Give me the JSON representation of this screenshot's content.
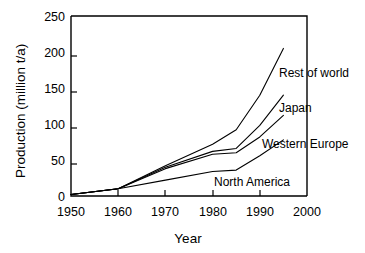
{
  "chart_data": {
    "type": "line",
    "title": "",
    "xlabel": "Year",
    "ylabel": "Production (million t/a)",
    "xlim": [
      1950,
      2000
    ],
    "ylim": [
      0,
      250
    ],
    "xticks": [
      1950,
      1960,
      1970,
      1980,
      1990,
      2000
    ],
    "yticks": [
      0,
      50,
      100,
      150,
      200,
      250
    ],
    "xtick_labels": [
      "1950",
      "1960",
      "1970",
      "1980",
      "1990",
      "2000"
    ],
    "ytick_labels": [
      "0",
      "50",
      "100",
      "150",
      "200",
      "250"
    ],
    "grid": false,
    "legend": "inline-annotations",
    "series": [
      {
        "name": "Rest of world",
        "x": [
          1950,
          1960,
          1970,
          1980,
          1985,
          1990,
          1995
        ],
        "values": [
          2,
          10,
          42,
          72,
          92,
          140,
          205
        ]
      },
      {
        "name": "Japan",
        "x": [
          1950,
          1960,
          1970,
          1980,
          1985,
          1990,
          1995
        ],
        "values": [
          2,
          10,
          40,
          62,
          66,
          98,
          140
        ]
      },
      {
        "name": "Western Europe",
        "x": [
          1950,
          1960,
          1970,
          1980,
          1985,
          1990,
          1995
        ],
        "values": [
          2,
          10,
          38,
          58,
          60,
          82,
          112
        ]
      },
      {
        "name": "North America",
        "x": [
          1950,
          1960,
          1970,
          1980,
          1985,
          1990,
          1995
        ],
        "values": [
          2,
          10,
          22,
          34,
          36,
          56,
          78
        ]
      }
    ]
  },
  "annotations": [
    {
      "label": "Rest of world",
      "x": 279,
      "y": 77
    },
    {
      "label": "Japan",
      "x": 279,
      "y": 112
    },
    {
      "label": "Western Europe",
      "x": 262,
      "y": 148
    },
    {
      "label": "North America",
      "x": 214,
      "y": 186
    }
  ]
}
